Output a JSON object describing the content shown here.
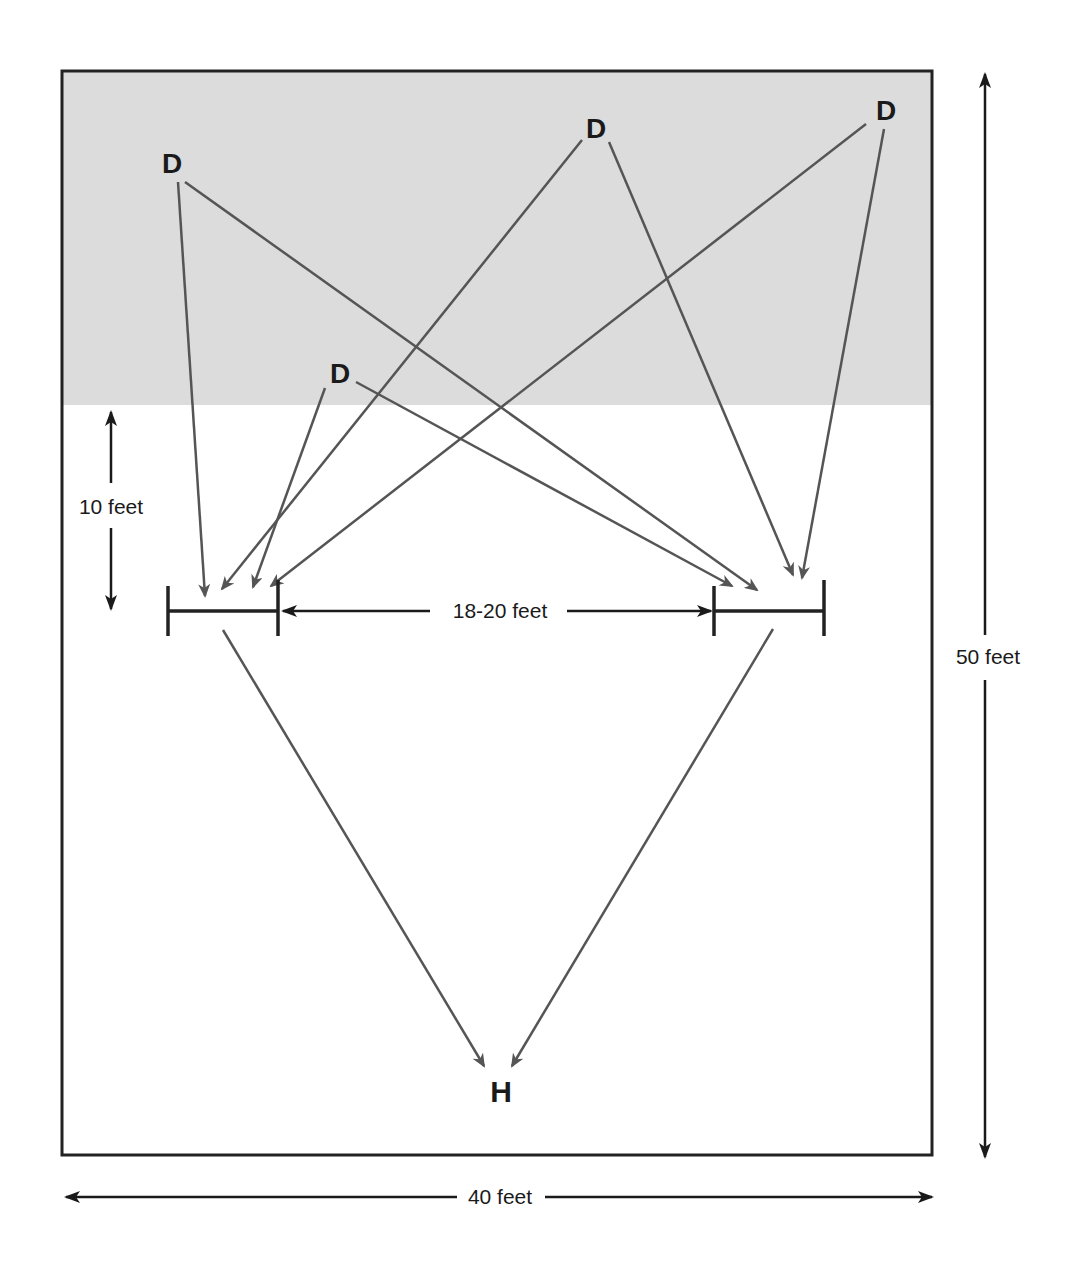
{
  "diagram": {
    "title": "",
    "colors": {
      "shaded_zone": "#dcdcdc",
      "border": "#222222",
      "pass_arrow": "#555555",
      "dimension_arrow": "#1a1a1a"
    },
    "field": {
      "width_label": "40 feet",
      "length_label": "50 feet"
    },
    "dimensions": {
      "gap_label": "18-20 feet",
      "depth_label": "10 feet"
    },
    "markers": {
      "defenders": [
        {
          "id": "d1",
          "label": "D"
        },
        {
          "id": "d2",
          "label": "D"
        },
        {
          "id": "d3",
          "label": "D"
        },
        {
          "id": "d4",
          "label": "D"
        }
      ],
      "home": {
        "id": "h",
        "label": "H"
      }
    },
    "goals": [
      {
        "id": "left-goal"
      },
      {
        "id": "right-goal"
      }
    ]
  }
}
